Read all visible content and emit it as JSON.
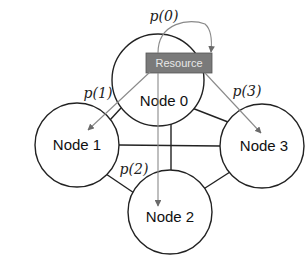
{
  "diagram": {
    "nodes": [
      {
        "id": 0,
        "label": "Node 0",
        "cx": 158,
        "cy": 80,
        "r": 46
      },
      {
        "id": 1,
        "label": "Node 1",
        "cx": 77,
        "cy": 145,
        "r": 42
      },
      {
        "id": 2,
        "label": "Node 2",
        "cx": 170,
        "cy": 212,
        "r": 42
      },
      {
        "id": 3,
        "label": "Node 3",
        "cx": 262,
        "cy": 146,
        "r": 42
      }
    ],
    "edges": [
      {
        "from": 0,
        "to": 1
      },
      {
        "from": 0,
        "to": 3
      },
      {
        "from": 1,
        "to": 2
      },
      {
        "from": 2,
        "to": 3
      },
      {
        "from": 1,
        "to": 3
      },
      {
        "from": 0,
        "to": 2
      }
    ],
    "resource": {
      "label": "Resource",
      "fill": "#7a7a7a"
    },
    "arrows": [
      {
        "label": "p(0)",
        "target": "Node 0 (self)"
      },
      {
        "label": "p(1)",
        "target": "Node 1"
      },
      {
        "label": "p(2)",
        "target": "Node 2"
      },
      {
        "label": "p(3)",
        "target": "Node 3"
      }
    ],
    "colors": {
      "edge": "#222222",
      "arrow": "#8a8a8a"
    }
  }
}
